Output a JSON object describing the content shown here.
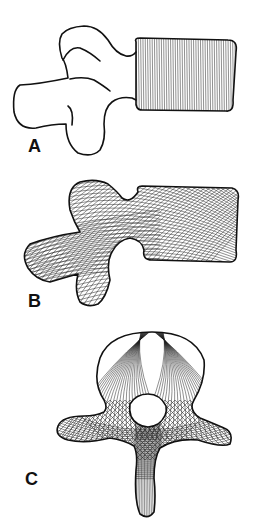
{
  "figure": {
    "panels": [
      {
        "id": "A",
        "label": "A",
        "view": "lateral",
        "pattern": "vertical parallel lines in vertebral body"
      },
      {
        "id": "B",
        "label": "B",
        "view": "lateral",
        "pattern": "crossing oblique trabecular arcs"
      },
      {
        "id": "C",
        "label": "C",
        "view": "superior/axial",
        "pattern": "radiating arcs and crosshatched processes"
      }
    ]
  },
  "colors": {
    "ink": "#111111",
    "background": "#ffffff"
  }
}
